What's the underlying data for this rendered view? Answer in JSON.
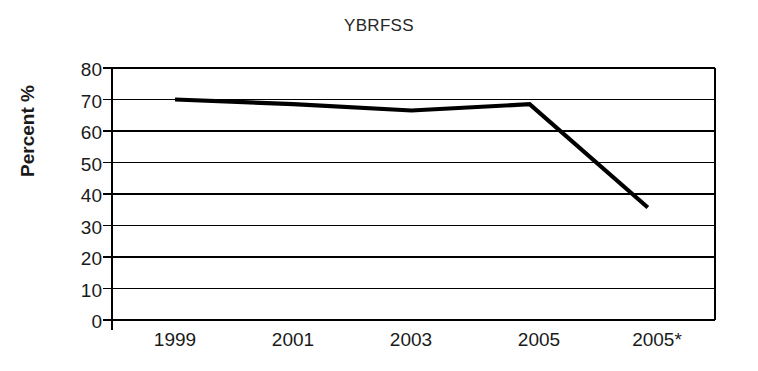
{
  "chart_data": {
    "type": "line",
    "title": "YBRFSS",
    "xlabel": "",
    "ylabel": "Percent %",
    "categories": [
      "1999",
      "2001",
      "2003",
      "2005",
      "2005*"
    ],
    "values": [
      70,
      68.5,
      66.5,
      68.5,
      35.7
    ],
    "series": [
      {
        "name": "YBRFSS",
        "values": [
          70,
          68.5,
          66.5,
          68.5,
          35.7
        ]
      }
    ],
    "ylim": [
      0,
      80
    ],
    "y_ticks": [
      "80",
      "70",
      "60",
      "50",
      "40",
      "30",
      "20",
      "10",
      "0"
    ],
    "y_tick_values": [
      80,
      70,
      60,
      50,
      40,
      30,
      20,
      10,
      0
    ],
    "grid": true,
    "grid_axis": "y",
    "legend": false,
    "legend_position": "none",
    "line_color": "#000000",
    "grid_color": "#000000",
    "axis_color": "#000000",
    "background_color": "#ffffff",
    "markers": false
  }
}
